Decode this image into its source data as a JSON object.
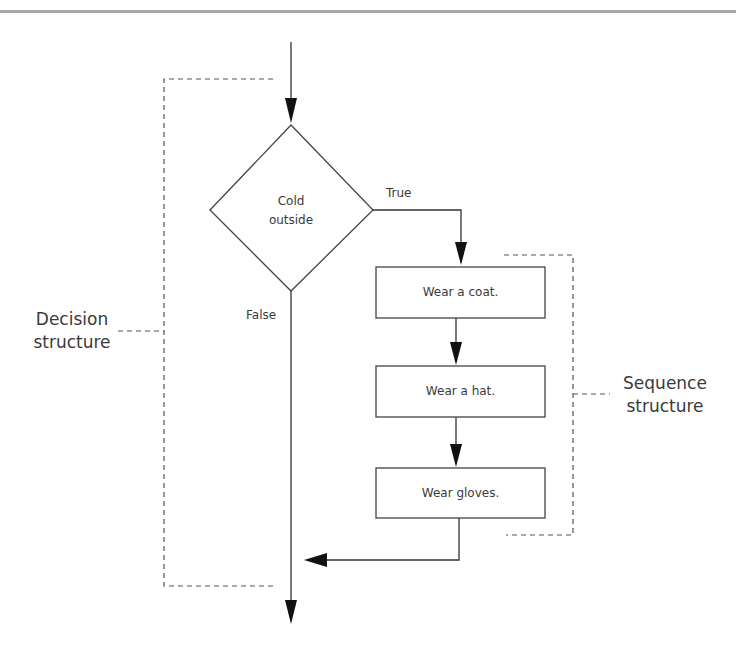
{
  "diagram": {
    "type": "flowchart",
    "decision": {
      "text_line1": "Cold",
      "text_line2": "outside",
      "true_label": "True",
      "false_label": "False"
    },
    "steps": [
      {
        "label": "Wear a coat."
      },
      {
        "label": "Wear a hat."
      },
      {
        "label": "Wear gloves."
      }
    ],
    "annotations": {
      "decision_structure_line1": "Decision",
      "decision_structure_line2": "structure",
      "sequence_structure_line1": "Sequence",
      "sequence_structure_line2": "structure"
    }
  }
}
